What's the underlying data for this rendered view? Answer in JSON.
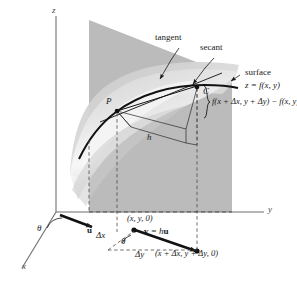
{
  "figure": {
    "type": "3d-calculus-diagram",
    "background": "#ffffff",
    "ink": "#1a1a1a",
    "plane_fill": "#b3b3b3",
    "surface_fill": "#d9d9d9"
  },
  "axes": {
    "z_label": "z",
    "y_label": "y",
    "x_label": "x"
  },
  "labels": {
    "tangent": "tangent",
    "secant": "secant",
    "surface": "surface",
    "surface_equation": "z = f(x, y)",
    "curve_C": "C",
    "point_P": "P",
    "height_h": "h",
    "difference_quotient": "f(x + Δx, y + Δy) − f(x, y)",
    "base_point": "(x, y, 0)",
    "end_point": "(x + Δx, y + Δy, 0)",
    "vector_u": "u",
    "vector_v_equation": "v = hu",
    "delta_x": "Δx",
    "delta_y": "Δy",
    "theta_origin": "θ",
    "theta_base": "θ"
  },
  "icons": {
    "arrowhead": "arrowhead-icon",
    "leader_line": "leader-line-icon",
    "point_dot": "point-dot-icon",
    "dashed_guide": "dashed-guide-icon",
    "brace": "curly-brace-icon"
  }
}
